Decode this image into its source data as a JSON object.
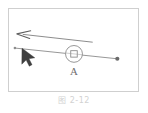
{
  "figure": {
    "caption": "图 2-12",
    "frame": {
      "border_color": "#cfcfcf",
      "background": "#ffffff",
      "x": 8,
      "y": 8,
      "width": 131,
      "height": 84
    },
    "labels": {
      "pivot": "A"
    },
    "colors": {
      "line": "#7a7a7a",
      "arrow": "#6b6b6b",
      "cursor": "#3f3f3f",
      "pivot_stroke": "#8a8a8a",
      "endpoint": "#6b6b6b",
      "caption": "#d2d2d2"
    },
    "elements": [
      {
        "name": "lever-rod",
        "type": "line",
        "x1": 14,
        "y1": 48,
        "x2": 118,
        "y2": 59,
        "description": "slanted rod passing through pivot"
      },
      {
        "name": "force-arrow",
        "type": "arrow",
        "x1": 93,
        "y1": 42,
        "x2": 19,
        "y2": 34,
        "direction": "left",
        "description": "force vector arrow pointing left"
      },
      {
        "name": "pivot-joint",
        "type": "circle-with-square",
        "cx": 74,
        "cy": 54,
        "r": 9,
        "inner_size": 6,
        "description": "pivot A: circle containing small square"
      },
      {
        "name": "cursor-pointer",
        "type": "filled-triangle",
        "cx": 22,
        "cy": 50,
        "description": "filled triangular mouse cursor"
      },
      {
        "name": "right-endpoint",
        "type": "dot",
        "cx": 118,
        "cy": 59,
        "r": 2,
        "description": "small filled dot at right end of rod"
      },
      {
        "name": "left-endpoint",
        "type": "dot",
        "cx": 14,
        "cy": 48,
        "r": 1.4,
        "description": "small dot at left end of rod"
      }
    ]
  }
}
